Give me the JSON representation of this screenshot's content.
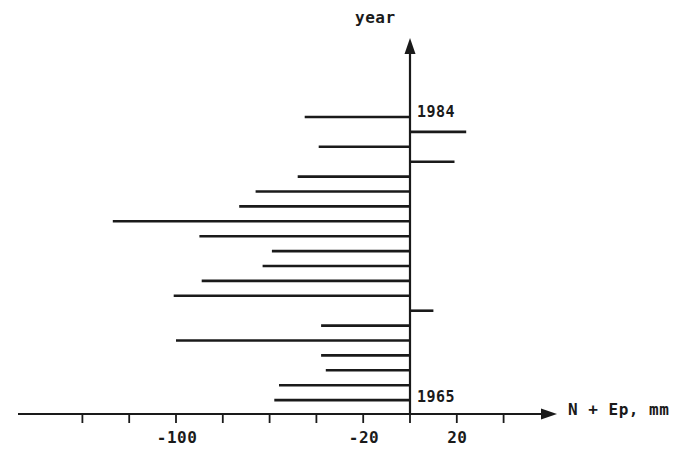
{
  "figure": {
    "background_color": "#ffffff",
    "ink_color": "#1a1a1a"
  },
  "axes": {
    "y_axis_title": "year",
    "x_axis_title": "N + Ep, mm",
    "x_tick_labels": [
      "-100",
      "-20",
      "20"
    ],
    "year_label_top": "1984",
    "year_label_bottom": "1965"
  },
  "chart_data": {
    "type": "bar",
    "orientation": "horizontal",
    "title": "",
    "subtitle": "",
    "xlabel": "N + Ep, mm",
    "ylabel": "year",
    "xlim": [
      -130,
      30
    ],
    "ylim": [
      1964.5,
      1984.5
    ],
    "grid": false,
    "legend": null,
    "x_ticks_labeled": [
      -100,
      -20,
      20
    ],
    "x_ticks_minor": [
      -140,
      -120,
      -100,
      -80,
      -60,
      -40,
      -20,
      0,
      20,
      40
    ],
    "baseline": 0,
    "categories": [
      "1984",
      "1983",
      "1982",
      "1981",
      "1980",
      "1979",
      "1978",
      "1977",
      "1976",
      "1975",
      "1974",
      "1973",
      "1972",
      "1971",
      "1970",
      "1969",
      "1968",
      "1967",
      "1966",
      "1965"
    ],
    "values": [
      -45,
      24,
      -39,
      19,
      -48,
      -66,
      -73,
      -127,
      -90,
      -59,
      -63,
      -89,
      -101,
      10,
      -38,
      -100,
      -38,
      -36,
      -56,
      -58
    ],
    "series": [
      {
        "name": "N + Ep",
        "values": [
          -45,
          24,
          -39,
          19,
          -48,
          -66,
          -73,
          -127,
          -90,
          -59,
          -63,
          -89,
          -101,
          10,
          -38,
          -100,
          -38,
          -36,
          -56,
          -58
        ]
      }
    ]
  }
}
